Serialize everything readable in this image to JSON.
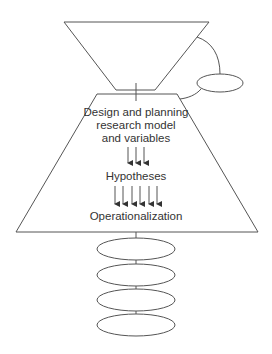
{
  "diagram": {
    "top_funnel": {
      "shape": "inverted-trapezoid"
    },
    "side_node": {
      "shape": "ellipse"
    },
    "main_block": {
      "shape": "trapezoid",
      "lines": [
        "Design and planning",
        "research model",
        "and variables"
      ],
      "arrows_1_count": 3,
      "middle_label": "Hypotheses",
      "arrows_2_count": 6,
      "bottom_label": "Operationalization"
    },
    "stacked_ellipses": {
      "count": 4
    },
    "colors": {
      "line": "#555555",
      "text": "#333333",
      "background": "#ffffff"
    }
  }
}
